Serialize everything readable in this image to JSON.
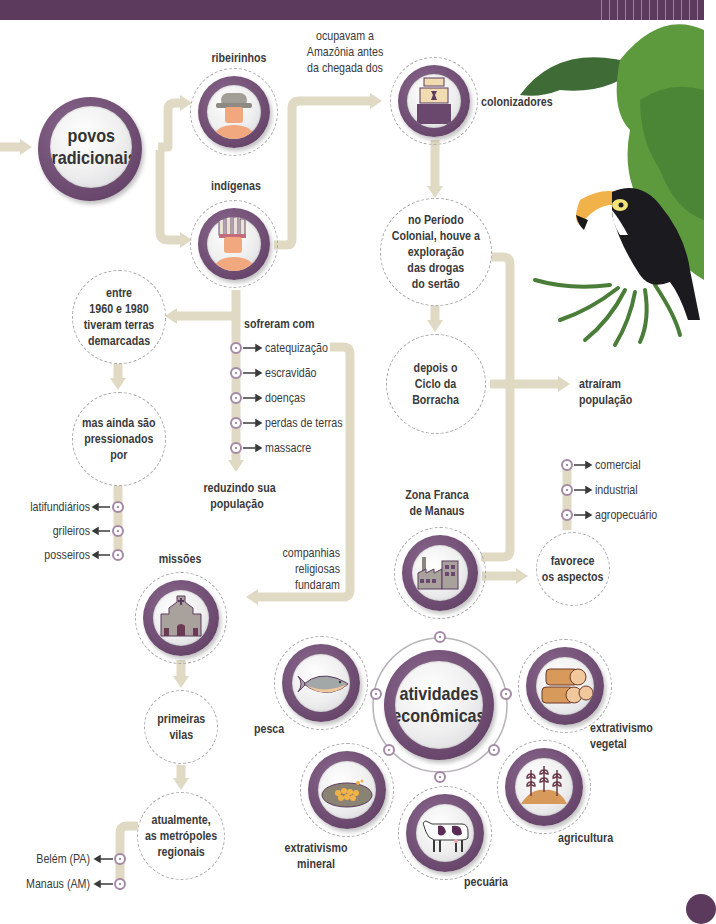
{
  "diagram": {
    "type": "concept-map",
    "colors": {
      "header_bar": "#5b3a5e",
      "node_ring": "#6a486d",
      "connector": "#e0d9c3",
      "text": "#3a3a3a",
      "bullet": "#a48aa6"
    },
    "nodes": {
      "povos_tradicionais": "povos tradicionais",
      "ribeirinhos": "ribeirinhos",
      "indigenas": "indígenas",
      "ocupavam_label": "ocupavam a Amazônia antes da chegada dos",
      "colonizadores": "colonizadores",
      "periodo_colonial": "no Período Colonial, houve a exploração das drogas do sertão",
      "ciclo_borracha": "depois o Ciclo da Borracha",
      "atrairam": "atraíram população",
      "entre_1960": "entre 1960 e 1980 tiveram terras demarcadas",
      "pressionados": "mas ainda são pressionados por",
      "sofreram_com": "sofreram com",
      "reduzindo": "reduzindo sua população",
      "companhias": "companhias religiosas fundaram",
      "missoes": "missões",
      "primeiras_vilas": "primeiras vilas",
      "atualmente": "atualmente, as metrópoles regionais",
      "zona_franca": "Zona Franca de Manaus",
      "favorece": "favorece os aspectos",
      "atividades": "atividades econômicas"
    },
    "text_lines": {
      "povos": [
        "povos",
        "tradicionais"
      ],
      "ocupavam": [
        "ocupavam a",
        "Amazônia antes",
        "da chegada dos"
      ],
      "periodo": [
        "no Período",
        "Colonial, houve a",
        "exploração",
        "das drogas",
        "do sertão"
      ],
      "ciclo": [
        "depois o",
        "Ciclo da",
        "Borracha"
      ],
      "atrairam": [
        "atraíram",
        "população"
      ],
      "entre": [
        "entre",
        "1960 e 1980",
        "tiveram terras",
        "demarcadas"
      ],
      "pressionados": [
        "mas ainda são",
        "pressionados",
        "por"
      ],
      "reduzindo": [
        "reduzindo sua",
        "população"
      ],
      "companhias": [
        "companhias",
        "religiosas",
        "fundaram"
      ],
      "vilas": [
        "primeiras",
        "vilas"
      ],
      "atualmente": [
        "atualmente,",
        "as metrópoles",
        "regionais"
      ],
      "zona": [
        "Zona Franca",
        "de Manaus"
      ],
      "favorece": [
        "favorece",
        "os aspectos"
      ],
      "atividades": [
        "atividades",
        "econômicas"
      ]
    },
    "sofreram_list": [
      "catequização",
      "escravidão",
      "doenças",
      "perdas de terras",
      "massacre"
    ],
    "pressionados_list": [
      "latifundiários",
      "grileiros",
      "posseiros"
    ],
    "metropoles_list": [
      "Belém (PA)",
      "Manaus (AM)"
    ],
    "aspectos_list": [
      "comercial",
      "industrial",
      "agropecuário"
    ],
    "atividades_list": [
      {
        "label": "pesca",
        "icon": "fish-icon"
      },
      {
        "label": "extrativismo vegetal",
        "lines": [
          "extrativismo",
          "vegetal"
        ],
        "icon": "logs-icon"
      },
      {
        "label": "agricultura",
        "icon": "wheat-icon"
      },
      {
        "label": "pecuária",
        "icon": "cow-icon"
      },
      {
        "label": "extrativismo mineral",
        "lines": [
          "extrativismo",
          "mineral"
        ],
        "icon": "gold-pan-icon"
      }
    ]
  }
}
